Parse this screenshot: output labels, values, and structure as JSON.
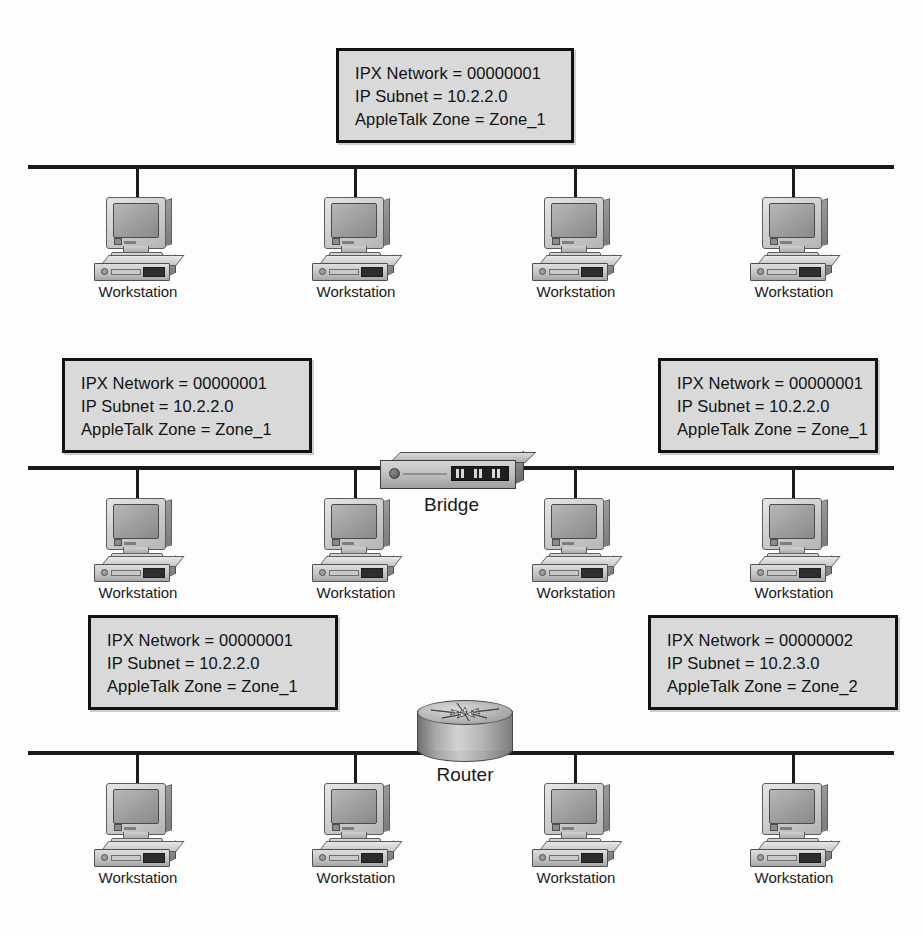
{
  "diagram": {
    "background_color": "#fdfdfd",
    "line_color": "#1a1a1a",
    "box_fill_color": "#d9d9d9",
    "box_border_color": "#111111"
  },
  "labels": {
    "workstation": "Workstation",
    "bridge": "Bridge",
    "router": "Router"
  },
  "annotation_boxes": [
    {
      "id": "top-center",
      "ipx": "IPX Network = 00000001",
      "subnet": "IP Subnet = 10.2.2.0",
      "zone": "AppleTalk Zone = Zone_1"
    },
    {
      "id": "middle-left",
      "ipx": "IPX Network = 00000001",
      "subnet": "IP Subnet = 10.2.2.0",
      "zone": "AppleTalk Zone = Zone_1"
    },
    {
      "id": "middle-right",
      "ipx": "IPX Network = 00000001",
      "subnet": "IP Subnet = 10.2.2.0",
      "zone": "AppleTalk Zone = Zone_1"
    },
    {
      "id": "bottom-left",
      "ipx": "IPX Network = 00000001",
      "subnet": "IP Subnet = 10.2.2.0",
      "zone": "AppleTalk Zone = Zone_1"
    },
    {
      "id": "bottom-right",
      "ipx": "IPX Network = 00000002",
      "subnet": "IP Subnet = 10.2.3.0",
      "zone": "AppleTalk Zone = Zone_2"
    }
  ],
  "segments": [
    {
      "id": "segment-top",
      "workstation_count": 4,
      "device": null
    },
    {
      "id": "segment-middle",
      "workstation_count": 4,
      "device": "bridge"
    },
    {
      "id": "segment-bottom",
      "workstation_count": 4,
      "device": "router"
    }
  ]
}
